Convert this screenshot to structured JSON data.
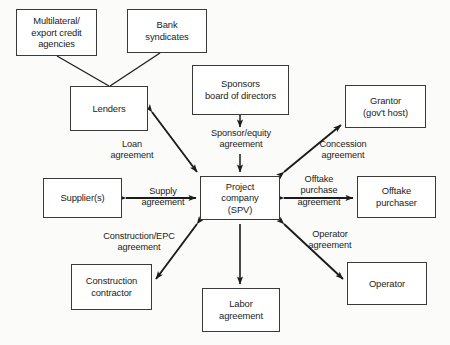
{
  "diagram": {
    "nodes": [
      {
        "id": "multilateral",
        "label": "Multilateral/\nexport credit\nagencies",
        "x": 16,
        "y": 9,
        "w": 81,
        "h": 47
      },
      {
        "id": "bank_syndicates",
        "label": "Bank\nsyndicates",
        "x": 127,
        "y": 9,
        "w": 80,
        "h": 44
      },
      {
        "id": "lenders",
        "label": "Lenders",
        "x": 70,
        "y": 86,
        "w": 78,
        "h": 45
      },
      {
        "id": "sponsors",
        "label": "Sponsors\nboard of directors",
        "x": 192,
        "y": 65,
        "w": 97,
        "h": 50
      },
      {
        "id": "grantor",
        "label": "Grantor\n(gov't host)",
        "x": 345,
        "y": 85,
        "w": 81,
        "h": 43
      },
      {
        "id": "supplier",
        "label": "Supplier(s)",
        "x": 43,
        "y": 178,
        "w": 79,
        "h": 40
      },
      {
        "id": "project_company",
        "label": "Project\ncompany\n(SPV)",
        "x": 200,
        "y": 176,
        "w": 80,
        "h": 44
      },
      {
        "id": "offtake_purchaser",
        "label": "Offtake\npurchaser",
        "x": 357,
        "y": 176,
        "w": 79,
        "h": 42
      },
      {
        "id": "construction_contractor",
        "label": "Construction\ncontractor",
        "x": 71,
        "y": 264,
        "w": 81,
        "h": 46
      },
      {
        "id": "labor_agreement",
        "label": "Labor\nagreement",
        "x": 202,
        "y": 288,
        "w": 78,
        "h": 44
      },
      {
        "id": "operator",
        "label": "Operator",
        "x": 347,
        "y": 262,
        "w": 80,
        "h": 43
      }
    ],
    "edge_labels": [
      {
        "id": "loan",
        "label": "Loan\nagreement",
        "x": 96,
        "y": 139,
        "w": 72
      },
      {
        "id": "sponsor_equity",
        "label": "Sponsor/equity\nagreement",
        "x": 200,
        "y": 128,
        "w": 82
      },
      {
        "id": "concession",
        "label": "Concession\nagreement",
        "x": 307,
        "y": 139,
        "w": 72
      },
      {
        "id": "supply",
        "label": "Supply\nagreement",
        "x": 132,
        "y": 186,
        "w": 62
      },
      {
        "id": "offtake_purchase",
        "label": "Offtake\npurchase\nagreement",
        "x": 286,
        "y": 174,
        "w": 66
      },
      {
        "id": "construction_epc",
        "label": "Construction/EPC\nagreement",
        "x": 89,
        "y": 231,
        "w": 100
      },
      {
        "id": "operator_agreement",
        "label": "Operator\nagreement",
        "x": 295,
        "y": 229,
        "w": 70
      }
    ],
    "edges": [
      {
        "id": "multilateral-to-lenders",
        "from": "multilateral",
        "to": "lenders",
        "arrows": "none"
      },
      {
        "id": "bank-syndicates-to-lenders",
        "from": "bank_syndicates",
        "to": "lenders",
        "arrows": "none"
      },
      {
        "id": "lenders-project-company",
        "from": "lenders",
        "to": "project_company",
        "arrows": "both",
        "label": "Loan agreement"
      },
      {
        "id": "sponsors-project-company",
        "from": "sponsors",
        "to": "project_company",
        "arrows": "end",
        "label": "Sponsor/equity agreement"
      },
      {
        "id": "project-company-grantor",
        "from": "project_company",
        "to": "grantor",
        "arrows": "both",
        "label": "Concession agreement"
      },
      {
        "id": "supplier-project-company",
        "from": "supplier",
        "to": "project_company",
        "arrows": "both",
        "label": "Supply agreement"
      },
      {
        "id": "project-company-offtake",
        "from": "project_company",
        "to": "offtake_purchaser",
        "arrows": "both",
        "label": "Offtake purchase agreement"
      },
      {
        "id": "project-company-construction",
        "from": "project_company",
        "to": "construction_contractor",
        "arrows": "both",
        "label": "Construction/EPC agreement"
      },
      {
        "id": "project-company-labor",
        "from": "project_company",
        "to": "labor_agreement",
        "arrows": "end"
      },
      {
        "id": "project-company-operator",
        "from": "project_company",
        "to": "operator",
        "arrows": "both",
        "label": "Operator agreement"
      }
    ],
    "colors": {
      "background": "#fbfbfa",
      "box_border": "#3a3a3a",
      "box_fill": "#ffffff",
      "line": "#1b1b1b",
      "text": "#1b1b1b"
    }
  }
}
